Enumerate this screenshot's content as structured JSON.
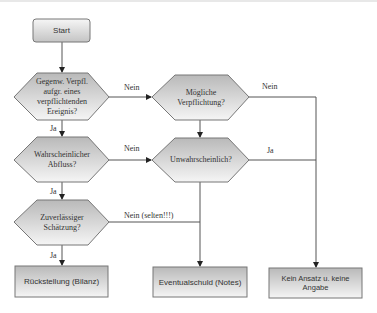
{
  "diagram": {
    "colors": {
      "fill_top": "#b9b9b9",
      "fill_bottom": "#f5f5f5",
      "stroke": "#6e6e6e",
      "line": "#555555"
    },
    "start": {
      "label": "Start"
    },
    "decisions": [
      {
        "id": "d1",
        "label": "Gegenw. Verpfl. aufgr. eines verpflichtenden Ereignis?"
      },
      {
        "id": "d2",
        "label": "Mögliche Verpflichtung?"
      },
      {
        "id": "d3",
        "label": "Wahrscheinlicher Abfluss?"
      },
      {
        "id": "d4",
        "label": "Unwahrscheinlich?"
      },
      {
        "id": "d5",
        "label": "Zuverlässiger Schätzung?"
      }
    ],
    "outcomes": [
      {
        "id": "o1",
        "label": "Rückstellung (Bilanz)"
      },
      {
        "id": "o2",
        "label": "Eventualschuld (Notes)"
      },
      {
        "id": "o3",
        "label": "Kein Ansatz u. keine Angabe"
      }
    ],
    "edges": [
      {
        "from": "start",
        "to": "d1",
        "label": ""
      },
      {
        "from": "d1",
        "to": "d2",
        "label": "Nein"
      },
      {
        "from": "d1",
        "to": "d3",
        "label": "Ja"
      },
      {
        "from": "d2",
        "to": "o3",
        "label": "Nein"
      },
      {
        "from": "d2",
        "to": "d4",
        "label": ""
      },
      {
        "from": "d3",
        "to": "d4",
        "label": "Nein"
      },
      {
        "from": "d3",
        "to": "d5",
        "label": "Ja"
      },
      {
        "from": "d4",
        "to": "o3",
        "label": "Ja"
      },
      {
        "from": "d4",
        "to": "o2",
        "label": ""
      },
      {
        "from": "d5",
        "to": "o2",
        "label": "Nein (selten!!!)"
      },
      {
        "from": "d5",
        "to": "o1",
        "label": "Ja"
      }
    ]
  }
}
